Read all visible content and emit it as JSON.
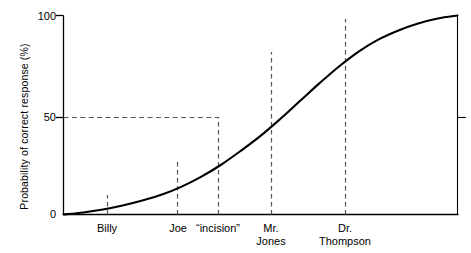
{
  "chart_data": {
    "type": "line",
    "title": "",
    "xlabel": "",
    "ylabel": "Probability of correct response (%)",
    "ylim": [
      0,
      100
    ],
    "yticks": [
      0,
      50,
      100
    ],
    "ytick_labels": [
      "0",
      "50",
      "100"
    ],
    "grid": false,
    "legend": null,
    "curve_shape": "sigmoid (ogive)",
    "series": [
      {
        "name": "Probability of correct response",
        "x": [
          0,
          5,
          10,
          15,
          20,
          25,
          30,
          35,
          40,
          45,
          50,
          55,
          60,
          65,
          70,
          75,
          80,
          85,
          90,
          95,
          100
        ],
        "values": [
          0,
          1,
          2.5,
          4.5,
          7,
          10,
          14,
          19,
          25,
          32,
          39.5,
          48,
          57,
          66,
          74.5,
          82,
          88,
          92.5,
          96,
          98.5,
          100
        ]
      }
    ],
    "markers": [
      {
        "label": "Billy",
        "x_frac": 0.137,
        "value": 10
      },
      {
        "label": "Joe",
        "x_frac": 0.289,
        "value": 28
      },
      {
        "label": "“incision”",
        "x_frac": 0.392,
        "value": 50
      },
      {
        "label": "Mr.\nJones",
        "x_frac": 0.527,
        "value": 82
      },
      {
        "label": "Dr.\nThompson",
        "x_frac": 0.714,
        "value": 99
      }
    ],
    "reference_lines": [
      {
        "orientation": "horizontal",
        "value": 50,
        "style": "dashed",
        "extends_to": "“incision” marker"
      }
    ],
    "right_axis_tick": 50,
    "colors": {
      "curve": "#000000",
      "axis": "#000000",
      "dashed": "#555555",
      "background": "#ffffff"
    }
  }
}
